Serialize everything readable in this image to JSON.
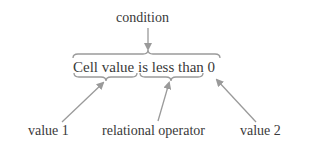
{
  "diagram": {
    "top_label": "condition",
    "expression": "Cell value is less than 0",
    "parts": [
      {
        "id": "value1",
        "text": "Cell value",
        "label": "value 1"
      },
      {
        "id": "operator",
        "text": "is less than",
        "label": "relational operator"
      },
      {
        "id": "value2",
        "text": "0",
        "label": "value 2"
      }
    ],
    "colors": {
      "text": "#3a3a3a",
      "arrow": "#9a9a9a"
    }
  }
}
